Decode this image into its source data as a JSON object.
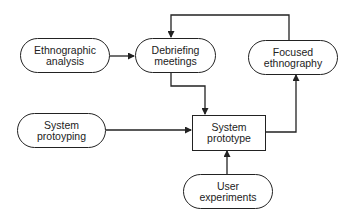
{
  "diagram": {
    "type": "flowchart",
    "nodes": [
      {
        "id": "ethnographic_analysis",
        "line1": "Ethnographic",
        "line2": "analysis",
        "shape": "rounded"
      },
      {
        "id": "debriefing_meetings",
        "line1": "Debriefing",
        "line2": "meetings",
        "shape": "rounded"
      },
      {
        "id": "focused_ethnography",
        "line1": "Focused",
        "line2": "ethnography",
        "shape": "rounded"
      },
      {
        "id": "system_protoyping",
        "line1": "System",
        "line2": "protoyping",
        "shape": "rounded"
      },
      {
        "id": "system_prototype",
        "line1": "System",
        "line2": "prototype",
        "shape": "rectangle"
      },
      {
        "id": "user_experiments",
        "line1": "User",
        "line2": "experiments",
        "shape": "rounded"
      }
    ],
    "edges": [
      {
        "from": "ethnographic_analysis",
        "to": "debriefing_meetings"
      },
      {
        "from": "debriefing_meetings",
        "to": "system_prototype"
      },
      {
        "from": "system_protoyping",
        "to": "system_prototype"
      },
      {
        "from": "user_experiments",
        "to": "system_prototype"
      },
      {
        "from": "system_prototype",
        "to": "focused_ethnography"
      },
      {
        "from": "focused_ethnography",
        "to": "debriefing_meetings"
      }
    ]
  }
}
